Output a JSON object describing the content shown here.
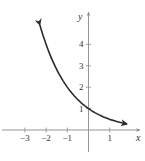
{
  "chart_data": {
    "type": "line",
    "title": "",
    "xlabel": "x",
    "ylabel": "y",
    "function": "y = (1/2)^x",
    "xlim": [
      -3.9,
      2.4
    ],
    "ylim": [
      -0.95,
      5.4
    ],
    "x_ticks": [
      -3,
      -2,
      -1,
      1
    ],
    "x_tick_labels": [
      "−3",
      "−2",
      "−1",
      "1"
    ],
    "y_ticks": [
      1,
      2,
      3,
      4
    ],
    "y_tick_labels": [
      "1",
      "2",
      "3",
      "4"
    ],
    "grid": false,
    "legend": null,
    "series": [
      {
        "name": "curve",
        "color": "#2a2a2a",
        "arrows": "both",
        "x": [
          -2.3,
          -2.0,
          -1.5,
          -1.0,
          -0.5,
          0.0,
          0.5,
          1.0,
          1.5,
          1.8
        ],
        "y": [
          4.92,
          4.0,
          2.83,
          2.0,
          1.41,
          1.0,
          0.71,
          0.5,
          0.35,
          0.29
        ]
      }
    ]
  },
  "colors": {
    "axis": "#8a8a8a",
    "curve": "#2a2a2a",
    "text": "#333333"
  }
}
